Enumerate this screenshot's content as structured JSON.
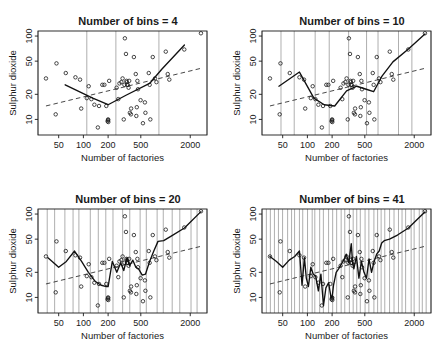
{
  "figure": {
    "width": 447,
    "height": 355,
    "background": "#ffffff",
    "axis_color": "#1a1a1a",
    "grid_color": "#8c8c8c",
    "fit_color": "#111111",
    "trend_color": "#333333"
  },
  "chart_data": [
    {
      "type": "scatter",
      "title": "Number of bins =  4",
      "xlabel": "Number of factories",
      "ylabel": "Sulphur dioxide",
      "xscale": "log",
      "yscale": "log",
      "xticks": [
        50,
        100,
        200,
        500,
        2000
      ],
      "yticks": [
        10,
        20,
        50,
        100
      ],
      "xlim": [
        28,
        3200
      ],
      "ylim": [
        6.5,
        115
      ],
      "grid": "vertical",
      "n_bins": 4,
      "bin_edges": [
        35,
        125,
        330,
        900,
        2700
      ],
      "x": [
        35,
        46,
        47,
        61,
        80,
        91,
        94,
        110,
        116,
        125,
        136,
        150,
        155,
        170,
        180,
        190,
        197,
        200,
        200,
        201,
        206,
        254,
        266,
        275,
        290,
        300,
        310,
        316,
        320,
        330,
        335,
        337,
        340,
        347,
        355,
        361,
        368,
        379,
        381,
        412,
        434,
        441,
        447,
        454,
        462,
        497,
        531,
        561,
        569,
        625,
        641,
        653,
        699,
        744,
        775,
        1007,
        1064,
        1112,
        1692,
        2700
      ],
      "y": [
        31,
        11.5,
        47,
        36,
        32,
        30,
        13.5,
        18,
        25,
        17.5,
        15,
        8,
        14.5,
        26,
        26,
        14.5,
        9.5,
        10,
        9.8,
        9.3,
        29,
        24,
        17.5,
        27,
        28,
        31,
        10,
        26,
        94,
        61,
        29,
        28,
        26,
        26,
        24,
        29,
        12,
        11.5,
        13.5,
        56,
        35,
        11,
        14,
        29,
        23,
        17,
        9,
        16,
        12,
        36,
        26,
        10,
        56,
        31,
        28,
        65,
        35,
        30,
        69,
        108
      ],
      "fit_x": [
        60,
        130,
        200,
        330,
        640,
        900,
        1700
      ],
      "fit_y": [
        26,
        18,
        15,
        19.5,
        27,
        40,
        78
      ],
      "trend_x": [
        35,
        2700
      ],
      "trend_y": [
        14.5,
        41
      ],
      "series": [
        {
          "name": "observations",
          "kind": "points"
        },
        {
          "name": "binned-mean-fit",
          "kind": "solid-line"
        },
        {
          "name": "linear-trend",
          "kind": "dashed-line"
        }
      ]
    },
    {
      "type": "scatter",
      "title": "Number of bins =  10",
      "xlabel": "Number of factories",
      "ylabel": "Sulphur dioxide",
      "xscale": "log",
      "yscale": "log",
      "xticks": [
        50,
        100,
        200,
        500,
        2000
      ],
      "yticks": [
        10,
        20,
        50,
        100
      ],
      "xlim": [
        28,
        3200
      ],
      "ylim": [
        6.5,
        115
      ],
      "grid": "vertical",
      "n_bins": 10,
      "x": [
        35,
        46,
        47,
        61,
        80,
        91,
        94,
        110,
        116,
        125,
        136,
        150,
        155,
        170,
        180,
        190,
        197,
        200,
        200,
        201,
        206,
        254,
        266,
        275,
        290,
        300,
        310,
        316,
        320,
        330,
        335,
        337,
        340,
        347,
        355,
        361,
        368,
        379,
        381,
        412,
        434,
        441,
        447,
        454,
        462,
        497,
        531,
        561,
        569,
        625,
        641,
        653,
        699,
        744,
        775,
        1007,
        1064,
        1112,
        1692,
        2700
      ],
      "y": [
        31,
        11.5,
        47,
        36,
        32,
        30,
        13.5,
        18,
        25,
        17.5,
        15,
        8,
        14.5,
        26,
        26,
        14.5,
        9.5,
        10,
        9.8,
        9.3,
        29,
        24,
        17.5,
        27,
        28,
        31,
        10,
        26,
        94,
        61,
        29,
        28,
        26,
        26,
        24,
        29,
        12,
        11.5,
        13.5,
        56,
        35,
        11,
        14,
        29,
        23,
        17,
        9,
        16,
        12,
        36,
        26,
        10,
        56,
        31,
        28,
        65,
        35,
        30,
        69,
        108
      ],
      "fit_x": [
        45,
        80,
        120,
        160,
        215,
        300,
        400,
        520,
        640,
        810,
        1100,
        1700,
        2700
      ],
      "fit_y": [
        25,
        37,
        18,
        15,
        14.5,
        22,
        25,
        23,
        21.5,
        33,
        49,
        70,
        106
      ],
      "trend_x": [
        35,
        2700
      ],
      "trend_y": [
        14.5,
        41
      ],
      "series": [
        {
          "name": "observations",
          "kind": "points"
        },
        {
          "name": "binned-mean-fit",
          "kind": "solid-line"
        },
        {
          "name": "linear-trend",
          "kind": "dashed-line"
        }
      ]
    },
    {
      "type": "scatter",
      "title": "Number of bins =  20",
      "xlabel": "Number of factories",
      "ylabel": "Sulphur dioxide",
      "xscale": "log",
      "yscale": "log",
      "xticks": [
        50,
        100,
        200,
        500,
        2000
      ],
      "yticks": [
        10,
        20,
        50,
        100
      ],
      "xlim": [
        28,
        3200
      ],
      "ylim": [
        6.5,
        115
      ],
      "grid": "vertical",
      "n_bins": 20,
      "x": [
        35,
        46,
        47,
        61,
        80,
        91,
        94,
        110,
        116,
        125,
        136,
        150,
        155,
        170,
        180,
        190,
        197,
        200,
        200,
        201,
        206,
        254,
        266,
        275,
        290,
        300,
        310,
        316,
        320,
        330,
        335,
        337,
        340,
        347,
        355,
        361,
        368,
        379,
        381,
        412,
        434,
        441,
        447,
        454,
        462,
        497,
        531,
        561,
        569,
        625,
        641,
        653,
        699,
        744,
        775,
        1007,
        1064,
        1112,
        1692,
        2700
      ],
      "y": [
        31,
        11.5,
        47,
        36,
        32,
        30,
        13.5,
        18,
        25,
        17.5,
        15,
        8,
        14.5,
        26,
        26,
        14.5,
        9.5,
        10,
        9.8,
        9.3,
        29,
        24,
        17.5,
        27,
        28,
        31,
        10,
        26,
        94,
        61,
        29,
        28,
        26,
        26,
        24,
        29,
        12,
        11.5,
        13.5,
        56,
        35,
        11,
        14,
        29,
        23,
        17,
        9,
        16,
        12,
        36,
        26,
        10,
        56,
        31,
        28,
        65,
        35,
        30,
        69,
        108
      ],
      "fit_x": [
        37,
        50,
        62,
        78,
        95,
        115,
        140,
        165,
        190,
        200,
        225,
        255,
        285,
        310,
        340,
        365,
        400,
        435,
        470,
        520,
        570,
        640,
        720,
        810,
        950,
        1200,
        1700,
        2700
      ],
      "fit_y": [
        30,
        23,
        27,
        36,
        27,
        20,
        15.5,
        14,
        13.5,
        13.5,
        27,
        20,
        26,
        21,
        30,
        24,
        28,
        23,
        22,
        18.5,
        19,
        27,
        36,
        47,
        48,
        55,
        68,
        107
      ],
      "trend_x": [
        35,
        2700
      ],
      "trend_y": [
        14.5,
        41
      ],
      "series": [
        {
          "name": "observations",
          "kind": "points"
        },
        {
          "name": "binned-mean-fit",
          "kind": "solid-line"
        },
        {
          "name": "linear-trend",
          "kind": "dashed-line"
        }
      ]
    },
    {
      "type": "scatter",
      "title": "Number of bins =  41",
      "xlabel": "Number of factories",
      "ylabel": "Sulphur dioxide",
      "xscale": "log",
      "yscale": "log",
      "xticks": [
        50,
        100,
        200,
        500,
        2000
      ],
      "yticks": [
        10,
        20,
        50,
        100
      ],
      "xlim": [
        28,
        3200
      ],
      "ylim": [
        6.5,
        115
      ],
      "grid": "vertical",
      "n_bins": 41,
      "x": [
        35,
        46,
        47,
        61,
        80,
        91,
        94,
        110,
        116,
        125,
        136,
        150,
        155,
        170,
        180,
        190,
        197,
        200,
        200,
        201,
        206,
        254,
        266,
        275,
        290,
        300,
        310,
        316,
        320,
        330,
        335,
        337,
        340,
        347,
        355,
        361,
        368,
        379,
        381,
        412,
        434,
        441,
        447,
        454,
        462,
        497,
        531,
        561,
        569,
        625,
        641,
        653,
        699,
        744,
        775,
        1007,
        1064,
        1112,
        1692,
        2700
      ],
      "y": [
        31,
        11.5,
        47,
        36,
        32,
        30,
        13.5,
        18,
        25,
        17.5,
        15,
        8,
        14.5,
        26,
        26,
        14.5,
        9.5,
        10,
        9.8,
        9.3,
        29,
        24,
        17.5,
        27,
        28,
        31,
        10,
        26,
        94,
        61,
        29,
        28,
        26,
        26,
        24,
        29,
        12,
        11.5,
        13.5,
        56,
        35,
        11,
        14,
        29,
        23,
        17,
        9,
        16,
        12,
        36,
        26,
        10,
        56,
        31,
        28,
        65,
        35,
        30,
        69,
        108
      ],
      "fit_x": [
        35,
        42,
        50,
        60,
        70,
        80,
        86,
        92,
        97,
        103,
        110,
        118,
        126,
        136,
        146,
        157,
        168,
        181,
        194,
        200,
        208,
        224,
        240,
        258,
        277,
        297,
        319,
        342,
        355,
        368,
        395,
        424,
        455,
        489,
        525,
        563,
        604,
        649,
        697,
        748,
        803,
        862,
        1000,
        1250,
        1700,
        2400,
        2700
      ],
      "fit_y": [
        31,
        27,
        23,
        28,
        31,
        36,
        14,
        30,
        17,
        13.5,
        23,
        19,
        18,
        12,
        19,
        8,
        13,
        15,
        10,
        10,
        14,
        20,
        22,
        25,
        28,
        33,
        26,
        44,
        26,
        22,
        31,
        17,
        27,
        20,
        17,
        29,
        20,
        27,
        33,
        36,
        45,
        48,
        50,
        56,
        68,
        95,
        106
      ],
      "trend_x": [
        35,
        2700
      ],
      "trend_y": [
        14.5,
        41
      ],
      "series": [
        {
          "name": "observations",
          "kind": "points"
        },
        {
          "name": "binned-mean-fit",
          "kind": "solid-line"
        },
        {
          "name": "linear-trend",
          "kind": "dashed-line"
        }
      ]
    }
  ]
}
